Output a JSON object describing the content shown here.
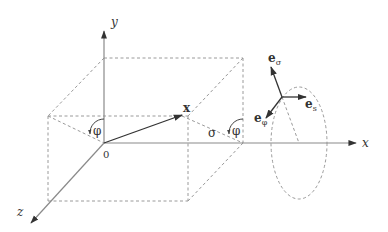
{
  "diagram": {
    "type": "coordinate-geometry",
    "labels": {
      "y_axis": "y",
      "x_axis": "x",
      "z_axis": "z",
      "origin": "0",
      "position_vector": "x",
      "phi_origin": "φ",
      "phi_corner": "φ",
      "sigma": "σ",
      "e_sigma_base": "e",
      "e_sigma_sub": "σ",
      "e_s_base": "e",
      "e_s_sub": "s",
      "e_phi_base": "e",
      "e_phi_sub": "φ"
    },
    "colors": {
      "axis": "#8a8a8a",
      "dashed": "#9a9a9a",
      "vector": "#333333",
      "text": "#333333",
      "background": "#ffffff"
    }
  }
}
